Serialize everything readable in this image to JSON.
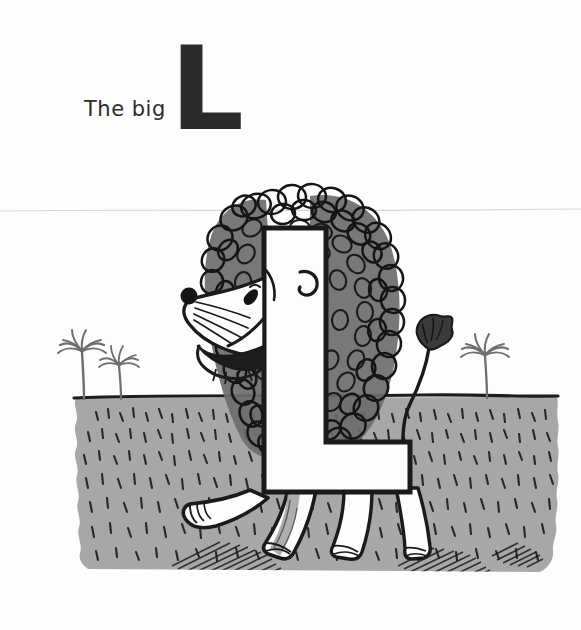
{
  "page": {
    "title": "The big L",
    "background_color": "#fdfdfc",
    "width": 581,
    "height": 630
  },
  "caption": {
    "text": "The big",
    "letter": "L",
    "ink_color": "#2b2b2b"
  },
  "illustration": {
    "description": "Ink and gray-wash drawing of a lion whose body is formed from the capital letter L, walking on a textured ground with palm trees",
    "subject_name": "lion-letter-l",
    "ink_color": "#1a1a1a",
    "ground_color": "#a8a8a8",
    "mane_fill_color": "#6d6d6d",
    "paper_color": "#ffffff",
    "elements": {
      "letter_body_label": "L",
      "mane_label": "mane",
      "head_label": "head",
      "nose_label": "nose",
      "eye_label": "eye",
      "ear_label": "ear",
      "mouth_label": "mouth",
      "whiskers_label": "whiskers",
      "tail_label": "tail",
      "tail_tuft_label": "tail tuft",
      "legs_label": "legs",
      "ground_label": "ground",
      "palm_left_label": "palm tree",
      "palm_left_small_label": "palm tree",
      "palm_right_label": "palm tree",
      "horizon_label": "horizon line",
      "shadow_label": "shadow"
    }
  }
}
